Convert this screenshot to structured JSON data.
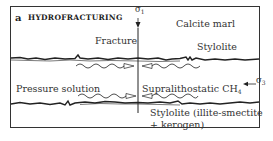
{
  "panel": {
    "letter": "a",
    "title": "HYDROFRACTURING"
  },
  "labels": {
    "sigma1": "σ",
    "sigma1_sub": "1",
    "sigma3": "σ",
    "sigma3_sub": "3",
    "fracture": "Fracture",
    "calcite_marl": "Calcite marl",
    "stylolite_upper": "Stylolite",
    "pressure_solution": "Pressure solution",
    "supralithostatic": "Supralithostatic CH",
    "supralithostatic_sub": "4",
    "stylolite_lower_line1": "Stylolite (illite-smectite",
    "stylolite_lower_line2": "+ kerogen)"
  },
  "colors": {
    "line": "#222222",
    "frame": "#333333",
    "background": "#ffffff"
  }
}
